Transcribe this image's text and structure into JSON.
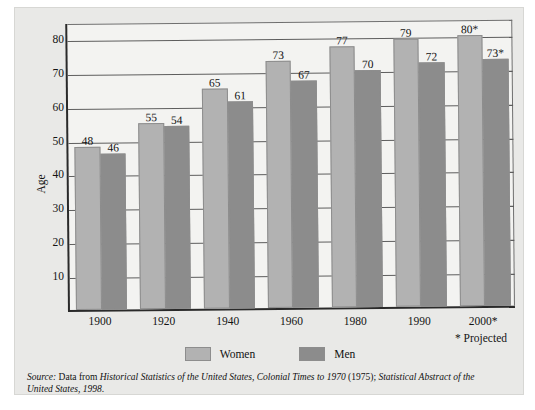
{
  "chart_data": {
    "type": "bar",
    "title": "",
    "xlabel": "",
    "ylabel": "Age",
    "ylim": [
      0,
      85
    ],
    "yticks": [
      10,
      20,
      30,
      40,
      50,
      60,
      70,
      80
    ],
    "grid": true,
    "legend_position": "bottom-center",
    "categories": [
      "1900",
      "1920",
      "1940",
      "1960",
      "1980",
      "1990",
      "2000*"
    ],
    "series": [
      {
        "name": "Women",
        "color": "#b2b2b2",
        "values": [
          48,
          55,
          65,
          73,
          77,
          79,
          80
        ],
        "labels": [
          "48",
          "55",
          "65",
          "73",
          "77",
          "79",
          "80*"
        ]
      },
      {
        "name": "Men",
        "color": "#8c8c8c",
        "values": [
          46,
          54,
          61,
          67,
          70,
          72,
          73
        ],
        "labels": [
          "46",
          "54",
          "61",
          "67",
          "70",
          "72",
          "73*"
        ]
      }
    ],
    "annotations": [
      "* Projected"
    ]
  },
  "axes": {
    "y_title": "Age",
    "y_ticks": [
      "80",
      "70",
      "60",
      "50",
      "40",
      "30",
      "20",
      "10"
    ],
    "x_ticks": [
      "1900",
      "1920",
      "1940",
      "1960",
      "1980",
      "1990",
      "2000*"
    ]
  },
  "legend": {
    "entries": [
      {
        "label": "Women"
      },
      {
        "label": "Men"
      }
    ]
  },
  "notes": {
    "projected": "* Projected"
  },
  "source": {
    "prefix": "Source:",
    "lead": " Data from ",
    "title1": "Historical Statistics of the United States, Colonial Times to 1970",
    "mid": " (1975); ",
    "title2": "Statistical Abstract of the United States, 1998",
    "end": "."
  },
  "colors": {
    "women": "#b2b2b2",
    "men": "#8c8c8c",
    "plot_background": "#f3f3f1",
    "figure_background": "#e9e9e7",
    "axis": "#2a2a2a",
    "gridline": "#5d5d5d"
  }
}
